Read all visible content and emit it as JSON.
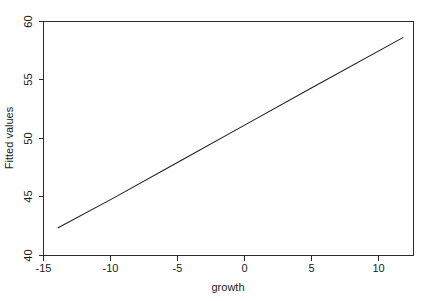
{
  "figure": {
    "background_color": "#ffffff",
    "line_color": "#1c1c1c",
    "axis_color": "#2b2b2b"
  },
  "chart_data": {
    "type": "line",
    "title": "",
    "subtitle": "",
    "xlabel": "growth",
    "ylabel": "Fitted values",
    "xlim": [
      -15.3,
      12.6
    ],
    "ylim": [
      40.0,
      60.3
    ],
    "xticks": [
      -15,
      -10,
      -5,
      0,
      5,
      10
    ],
    "xticklabels": [
      "-15",
      "-10",
      "-5",
      "0",
      "5",
      "10"
    ],
    "yticks": [
      40,
      45,
      50,
      55,
      60
    ],
    "yticklabels": [
      "40",
      "45",
      "50",
      "55",
      "60"
    ],
    "grid": false,
    "legend": null,
    "annotations": [],
    "series": [
      {
        "name": "Fitted values",
        "x": [
          -14.2,
          -10,
          -5,
          0,
          5,
          11.8
        ],
        "y": [
          42.4,
          45.0,
          48.2,
          51.4,
          54.6,
          58.9
        ],
        "style": "solid",
        "color": "#1c1c1c",
        "width": 1
      }
    ]
  }
}
